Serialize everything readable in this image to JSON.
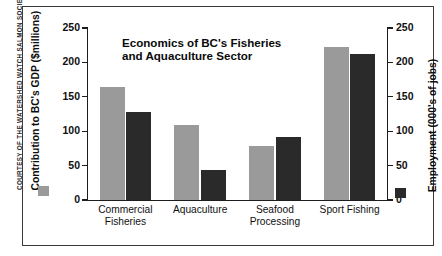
{
  "credit": "COURTESY OF THE WATERSHED WATCH SALMON SOCIETY",
  "chart_data": {
    "type": "bar",
    "title": "Economics of BC's Fisheries and Aquaculture Sector",
    "title_line1": "Economics of BC's Fisheries",
    "title_line2": "and Aquaculture Sector",
    "categories": [
      "Commercial Fisheries",
      "Aquaculture",
      "Seafood Processing",
      "Sport Fishing"
    ],
    "category_lines": [
      [
        "Commercial",
        "Fisheries"
      ],
      [
        "Aquaculture",
        ""
      ],
      [
        "Seafood",
        "Processing"
      ],
      [
        "Sport Fishing",
        ""
      ]
    ],
    "series": [
      {
        "name": "Contribution to BC's GDP ($millions)",
        "axis": "left",
        "color": "#9a9a9a",
        "values": [
          164,
          109,
          78,
          223
        ]
      },
      {
        "name": "Employment (000's of jobs)",
        "axis": "right",
        "color": "#2a2a2a",
        "values": [
          128,
          43,
          92,
          212
        ]
      }
    ],
    "ylabel_left": "Contribution to BC's GDP ($millions)",
    "ylabel_right": "Employment (000's of jobs)",
    "xlabel": "",
    "ylim_left": [
      0,
      250
    ],
    "ylim_right": [
      0,
      250
    ],
    "yticks_left": [
      250,
      200,
      150,
      100,
      50,
      0
    ],
    "yticks_right": [
      250,
      200,
      150,
      100,
      50,
      0
    ],
    "grid": false,
    "legend_position": "axis-titles"
  }
}
